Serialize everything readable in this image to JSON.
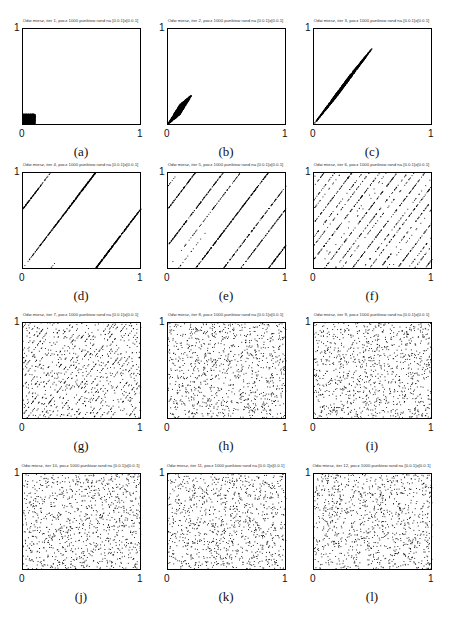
{
  "figure": {
    "panels": [
      {
        "id": "a",
        "caption": "(a)",
        "title": "Odw miesz, iter 1, pocz 1000 punktow rand na [0.0.1]x[0.0.1]",
        "iter": 1
      },
      {
        "id": "b",
        "caption": "(b)",
        "title": "Odw miesz, iter 2, pocz 1000 punktow rand na [0.0.1]x[0.0.1]",
        "iter": 2
      },
      {
        "id": "c",
        "caption": "(c)",
        "title": "Odw miesz, iter 3, pocz 1000 punktow rand na [0.0.1]x[0.0.1]",
        "iter": 3
      },
      {
        "id": "d",
        "caption": "(d)",
        "title": "Odw miesz, iter 4, pocz 1000 punktow rand na [0.0.1]x[0.0.1]",
        "iter": 4
      },
      {
        "id": "e",
        "caption": "(e)",
        "title": "Odw miesz, iter 5, pocz 1000 punktow rand na [0.0.1]x[0.0.1]",
        "iter": 5
      },
      {
        "id": "f",
        "caption": "(f)",
        "title": "Odw miesz, iter 6, pocz 1000 punktow rand na [0.0.1]x[0.0.1]",
        "iter": 6
      },
      {
        "id": "g",
        "caption": "(g)",
        "title": "Odw miesz, iter 7, pocz 1000 punktow rand na [0.0.1]x[0.0.1]",
        "iter": 7
      },
      {
        "id": "h",
        "caption": "(h)",
        "title": "Odw miesz, iter 8, pocz 1000 punktow rand na [0.0.1]x[0.0.1]",
        "iter": 8
      },
      {
        "id": "i",
        "caption": "(i)",
        "title": "Odw miesz, iter 9, pocz 1000 punktow rand na [0.0.1]x[0.0.1]",
        "iter": 9
      },
      {
        "id": "j",
        "caption": "(j)",
        "title": "Odw miesz, iter 10, pocz 1000 punktow rand na [0.0.1]x[0.0.1]",
        "iter": 10
      },
      {
        "id": "k",
        "caption": "(k)",
        "title": "Odw miesz, iter 11, pocz 1000 punktow rand na [0.0.1]x[0.0.1]",
        "iter": 11
      },
      {
        "id": "l",
        "caption": "(l)",
        "title": "Odw miesz, iter 12, pocz 1000 punktow rand na [0.0.1]x[0.0.1]",
        "iter": 12
      }
    ],
    "ticks": {
      "x_min": "0",
      "x_max": "1",
      "y_max": "1"
    }
  },
  "chart_data": {
    "type": "scatter",
    "n_points": 1000,
    "initial_region": {
      "x": [
        0,
        0.1
      ],
      "y": [
        0,
        0.1
      ]
    },
    "map_slope": 2,
    "xlim": [
      0,
      1
    ],
    "ylim": [
      0,
      1
    ],
    "xticks": [
      "0",
      "1"
    ],
    "yticks": [
      "1"
    ],
    "iterations": [
      1,
      2,
      3,
      4,
      5,
      6,
      7,
      8,
      9,
      10,
      11,
      12
    ],
    "colors": {
      "points": "#000000",
      "axes": "#000000"
    }
  }
}
